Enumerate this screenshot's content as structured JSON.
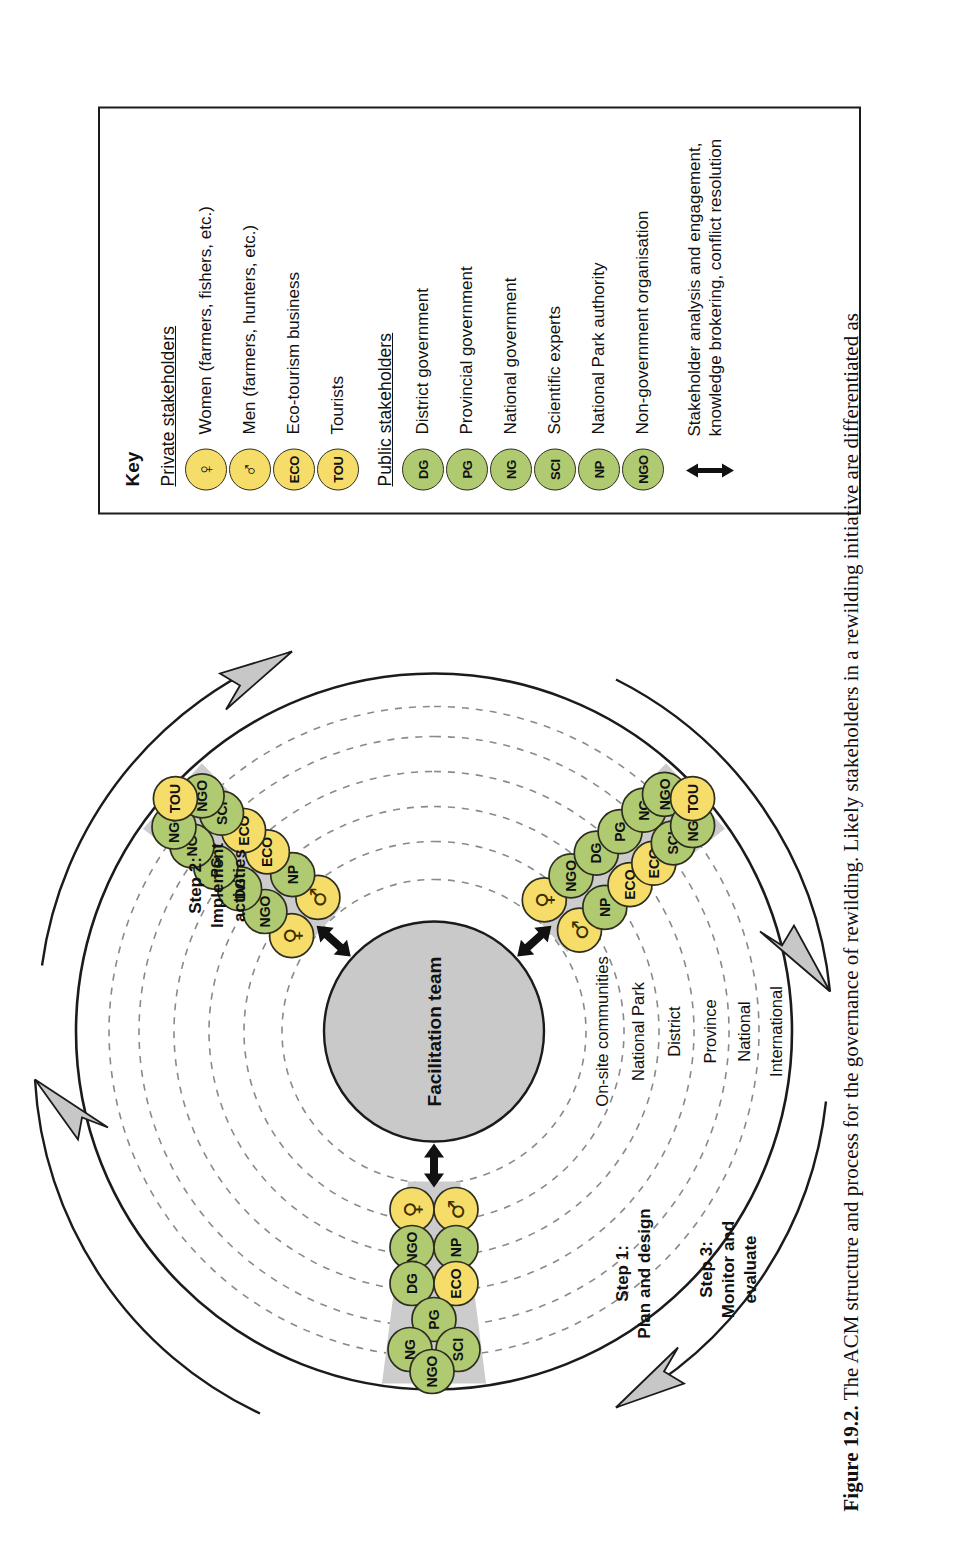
{
  "figure": {
    "number": "Figure 19.2.",
    "caption": "The ACM structure and process for the governance of rewilding. Likely stakeholders in a rewilding initiative are differentiated as"
  },
  "colors": {
    "private_fill": "#f6dd6a",
    "public_fill": "#b0ca72",
    "node_stroke": "#2e2e1f",
    "spoke_fill": "#cccccc",
    "facilitation_fill": "#c9c9c9",
    "arrow_fill": "#c7c7c7",
    "outline": "#1b1b1b"
  },
  "key": {
    "title": "Key",
    "sections": [
      {
        "heading": "Private stakeholders",
        "items": [
          {
            "code": "♀",
            "is_symbol": true,
            "type": "private",
            "label": "Women (farmers, fishers, etc.)",
            "icon": "female-symbol-icon"
          },
          {
            "code": "♂",
            "is_symbol": true,
            "type": "private",
            "label": "Men (farmers, hunters, etc.)",
            "icon": "male-symbol-icon"
          },
          {
            "code": "ECO",
            "is_symbol": false,
            "type": "private",
            "label": "Eco-tourism business",
            "icon": "eco-chip-icon"
          },
          {
            "code": "TOU",
            "is_symbol": false,
            "type": "private",
            "label": "Tourists",
            "icon": "tou-chip-icon"
          }
        ]
      },
      {
        "heading": "Public stakeholders",
        "items": [
          {
            "code": "DG",
            "is_symbol": false,
            "type": "public",
            "label": "District government",
            "icon": "dg-chip-icon"
          },
          {
            "code": "PG",
            "is_symbol": false,
            "type": "public",
            "label": "Provincial government",
            "icon": "pg-chip-icon"
          },
          {
            "code": "NG",
            "is_symbol": false,
            "type": "public",
            "label": "National government",
            "icon": "ng-chip-icon"
          },
          {
            "code": "SCI",
            "is_symbol": false,
            "type": "public",
            "label": "Scientific experts",
            "icon": "sci-chip-icon"
          },
          {
            "code": "NP",
            "is_symbol": false,
            "type": "public",
            "label": "National Park authority",
            "icon": "np-chip-icon"
          },
          {
            "code": "NGO",
            "is_symbol": false,
            "type": "public",
            "label": "Non-government organisation",
            "icon": "ngo-chip-icon"
          }
        ]
      }
    ],
    "note": {
      "icon": "double-headed-arrow-icon",
      "label": "Stakeholder analysis and engagement, knowledge brokering, conflict resolution"
    }
  },
  "diagram": {
    "center": {
      "label": "Facilitation team"
    },
    "rings": [
      {
        "label": "On-site communities"
      },
      {
        "label": "National Park"
      },
      {
        "label": "District"
      },
      {
        "label": "Province"
      },
      {
        "label": "National"
      },
      {
        "label": "International"
      }
    ],
    "steps": [
      {
        "id": "step-1",
        "label_line1": "Step 1:",
        "label_line2": "Plan and design",
        "nodes": [
          {
            "code": "♀",
            "type": "private",
            "is_symbol": true
          },
          {
            "code": "♂",
            "type": "private",
            "is_symbol": true
          },
          {
            "code": "NGO",
            "type": "public",
            "is_symbol": false
          },
          {
            "code": "NP",
            "type": "public",
            "is_symbol": false
          },
          {
            "code": "DG",
            "type": "public",
            "is_symbol": false
          },
          {
            "code": "ECO",
            "type": "private",
            "is_symbol": false
          },
          {
            "code": "PG",
            "type": "public",
            "is_symbol": false
          },
          {
            "code": "NG",
            "type": "public",
            "is_symbol": false
          },
          {
            "code": "SCI",
            "type": "public",
            "is_symbol": false
          },
          {
            "code": "NGO",
            "type": "public",
            "is_symbol": false
          }
        ]
      },
      {
        "id": "step-2",
        "label_line1": "Step 2:",
        "label_line2": "Implement",
        "label_line3": "activities",
        "nodes": [
          {
            "code": "♀",
            "type": "private",
            "is_symbol": true
          },
          {
            "code": "♂",
            "type": "private",
            "is_symbol": true
          },
          {
            "code": "NGO",
            "type": "public",
            "is_symbol": false
          },
          {
            "code": "NP",
            "type": "public",
            "is_symbol": false
          },
          {
            "code": "DG",
            "type": "public",
            "is_symbol": false
          },
          {
            "code": "ECO",
            "type": "private",
            "is_symbol": false
          },
          {
            "code": "PG",
            "type": "public",
            "is_symbol": false
          },
          {
            "code": "ECO",
            "type": "private",
            "is_symbol": false
          },
          {
            "code": "NG",
            "type": "public",
            "is_symbol": false
          },
          {
            "code": "SCI",
            "type": "public",
            "is_symbol": false
          },
          {
            "code": "NGO",
            "type": "public",
            "is_symbol": false
          },
          {
            "code": "NGO",
            "type": "public",
            "is_symbol": false
          },
          {
            "code": "TOU",
            "type": "private",
            "is_symbol": false
          }
        ]
      },
      {
        "id": "step-3",
        "label_line1": "Step 3:",
        "label_line2": "Monitor and",
        "label_line3": "evaluate",
        "nodes": [
          {
            "code": "♀",
            "type": "private",
            "is_symbol": true
          },
          {
            "code": "♂",
            "type": "private",
            "is_symbol": true
          },
          {
            "code": "NGO",
            "type": "public",
            "is_symbol": false
          },
          {
            "code": "NP",
            "type": "public",
            "is_symbol": false
          },
          {
            "code": "DG",
            "type": "public",
            "is_symbol": false
          },
          {
            "code": "ECO",
            "type": "private",
            "is_symbol": false
          },
          {
            "code": "PG",
            "type": "public",
            "is_symbol": false
          },
          {
            "code": "ECO",
            "type": "private",
            "is_symbol": false
          },
          {
            "code": "NG",
            "type": "public",
            "is_symbol": false
          },
          {
            "code": "SCI",
            "type": "public",
            "is_symbol": false
          },
          {
            "code": "NGO",
            "type": "public",
            "is_symbol": false
          },
          {
            "code": "NGO",
            "type": "public",
            "is_symbol": false
          },
          {
            "code": "TOU",
            "type": "private",
            "is_symbol": false
          }
        ]
      }
    ]
  }
}
